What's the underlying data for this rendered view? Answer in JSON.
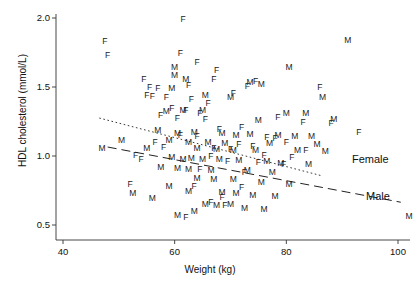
{
  "chart_data": {
    "type": "scatter",
    "title": "",
    "xlabel": "Weight (kg)",
    "ylabel": "HDL cholesterol (mmol/L)",
    "xlim": [
      40,
      103
    ],
    "ylim": [
      0.42,
      2.08
    ],
    "xticks": [
      40,
      60,
      80,
      100
    ],
    "yticks": [
      0.5,
      1.0,
      1.5,
      2.0
    ],
    "xtick_labels": [
      "40",
      "60",
      "80",
      "100"
    ],
    "ytick_labels": [
      "0.5",
      "1.0",
      "1.5",
      "2.0"
    ],
    "grid": false,
    "legend_position": "in-plot-right",
    "point_marker": "letter",
    "marker_meaning": {
      "F": "Female",
      "M": "Male"
    },
    "series": [
      {
        "name": "Female",
        "marker": "F",
        "trend_line": {
          "style": "dotted",
          "label": "Female",
          "x": [
            46.5,
            86.5
          ],
          "y": [
            1.275,
            0.855
          ]
        },
        "points": [
          {
            "x": 47.5,
            "y": 1.83
          },
          {
            "x": 48.0,
            "y": 1.735
          },
          {
            "x": 54.5,
            "y": 1.56
          },
          {
            "x": 55.5,
            "y": 1.5
          },
          {
            "x": 57.0,
            "y": 1.495
          },
          {
            "x": 61.5,
            "y": 1.99
          },
          {
            "x": 61.0,
            "y": 1.745
          },
          {
            "x": 64.0,
            "y": 1.68
          },
          {
            "x": 67.5,
            "y": 1.625
          },
          {
            "x": 67.0,
            "y": 1.555
          },
          {
            "x": 74.5,
            "y": 1.545
          },
          {
            "x": 62.5,
            "y": 1.515
          },
          {
            "x": 73.0,
            "y": 1.51
          },
          {
            "x": 86.0,
            "y": 1.5
          },
          {
            "x": 70.5,
            "y": 1.455
          },
          {
            "x": 55.0,
            "y": 1.44
          },
          {
            "x": 56.0,
            "y": 1.435
          },
          {
            "x": 58.5,
            "y": 1.43
          },
          {
            "x": 63.0,
            "y": 1.415
          },
          {
            "x": 66.0,
            "y": 1.385
          },
          {
            "x": 59.5,
            "y": 1.345
          },
          {
            "x": 62.0,
            "y": 1.335
          },
          {
            "x": 64.5,
            "y": 1.315
          },
          {
            "x": 57.5,
            "y": 1.3
          },
          {
            "x": 60.5,
            "y": 1.275
          },
          {
            "x": 65.5,
            "y": 1.265
          },
          {
            "x": 78.5,
            "y": 1.28
          },
          {
            "x": 83.0,
            "y": 1.245
          },
          {
            "x": 88.0,
            "y": 1.24
          },
          {
            "x": 72.0,
            "y": 1.21
          },
          {
            "x": 68.0,
            "y": 1.195
          },
          {
            "x": 93.0,
            "y": 1.175
          },
          {
            "x": 61.0,
            "y": 1.155
          },
          {
            "x": 64.0,
            "y": 1.145
          },
          {
            "x": 76.5,
            "y": 1.135
          },
          {
            "x": 78.0,
            "y": 1.13
          },
          {
            "x": 80.0,
            "y": 1.1
          },
          {
            "x": 56.5,
            "y": 1.1
          },
          {
            "x": 71.5,
            "y": 1.085
          },
          {
            "x": 74.0,
            "y": 1.075
          },
          {
            "x": 58.0,
            "y": 1.065
          },
          {
            "x": 67.0,
            "y": 1.06
          },
          {
            "x": 70.0,
            "y": 1.05
          },
          {
            "x": 83.5,
            "y": 1.045
          },
          {
            "x": 53.0,
            "y": 1.01
          },
          {
            "x": 66.5,
            "y": 1.0
          },
          {
            "x": 76.0,
            "y": 1.005
          },
          {
            "x": 81.0,
            "y": 0.99
          },
          {
            "x": 54.0,
            "y": 0.975
          },
          {
            "x": 69.5,
            "y": 0.965
          },
          {
            "x": 75.0,
            "y": 0.955
          },
          {
            "x": 79.5,
            "y": 0.945
          },
          {
            "x": 64.5,
            "y": 0.905
          },
          {
            "x": 72.5,
            "y": 0.885
          },
          {
            "x": 52.0,
            "y": 0.795
          },
          {
            "x": 63.5,
            "y": 0.78
          },
          {
            "x": 72.0,
            "y": 0.775
          },
          {
            "x": 68.5,
            "y": 0.7
          },
          {
            "x": 66.5,
            "y": 0.67
          },
          {
            "x": 69.0,
            "y": 0.645
          },
          {
            "x": 62.0,
            "y": 0.56
          }
        ]
      },
      {
        "name": "Male",
        "marker": "M",
        "trend_line": {
          "style": "dashed",
          "label": "Male",
          "x": [
            48.0,
            100.5
          ],
          "y": [
            1.065,
            0.665
          ]
        },
        "points": [
          {
            "x": 60.0,
            "y": 1.645
          },
          {
            "x": 60.0,
            "y": 1.585
          },
          {
            "x": 59.5,
            "y": 1.49
          },
          {
            "x": 62.0,
            "y": 1.56
          },
          {
            "x": 73.5,
            "y": 1.535
          },
          {
            "x": 75.5,
            "y": 1.52
          },
          {
            "x": 80.5,
            "y": 1.645
          },
          {
            "x": 91.0,
            "y": 1.84
          },
          {
            "x": 65.5,
            "y": 1.44
          },
          {
            "x": 70.0,
            "y": 1.43
          },
          {
            "x": 86.5,
            "y": 1.43
          },
          {
            "x": 58.5,
            "y": 1.325
          },
          {
            "x": 61.5,
            "y": 1.335
          },
          {
            "x": 65.0,
            "y": 1.33
          },
          {
            "x": 80.0,
            "y": 1.31
          },
          {
            "x": 83.5,
            "y": 1.31
          },
          {
            "x": 75.0,
            "y": 1.26
          },
          {
            "x": 88.5,
            "y": 1.265
          },
          {
            "x": 57.0,
            "y": 1.185
          },
          {
            "x": 60.5,
            "y": 1.17
          },
          {
            "x": 63.5,
            "y": 1.175
          },
          {
            "x": 68.5,
            "y": 1.165
          },
          {
            "x": 71.0,
            "y": 1.155
          },
          {
            "x": 73.5,
            "y": 1.16
          },
          {
            "x": 78.5,
            "y": 1.155
          },
          {
            "x": 81.5,
            "y": 1.145
          },
          {
            "x": 84.5,
            "y": 1.145
          },
          {
            "x": 50.5,
            "y": 1.115
          },
          {
            "x": 59.0,
            "y": 1.115
          },
          {
            "x": 62.5,
            "y": 1.105
          },
          {
            "x": 66.0,
            "y": 1.1
          },
          {
            "x": 69.0,
            "y": 1.095
          },
          {
            "x": 77.0,
            "y": 1.095
          },
          {
            "x": 85.5,
            "y": 1.09
          },
          {
            "x": 47.0,
            "y": 1.06
          },
          {
            "x": 55.0,
            "y": 1.06
          },
          {
            "x": 64.0,
            "y": 1.055
          },
          {
            "x": 67.5,
            "y": 1.05
          },
          {
            "x": 70.5,
            "y": 1.045
          },
          {
            "x": 74.5,
            "y": 1.04
          },
          {
            "x": 82.0,
            "y": 1.04
          },
          {
            "x": 87.0,
            "y": 1.035
          },
          {
            "x": 59.5,
            "y": 0.99
          },
          {
            "x": 61.5,
            "y": 0.98
          },
          {
            "x": 63.0,
            "y": 0.985
          },
          {
            "x": 65.0,
            "y": 0.975
          },
          {
            "x": 68.0,
            "y": 0.975
          },
          {
            "x": 71.5,
            "y": 0.97
          },
          {
            "x": 76.5,
            "y": 0.965
          },
          {
            "x": 79.0,
            "y": 0.95
          },
          {
            "x": 84.0,
            "y": 0.945
          },
          {
            "x": 57.5,
            "y": 0.92
          },
          {
            "x": 60.5,
            "y": 0.915
          },
          {
            "x": 62.5,
            "y": 0.905
          },
          {
            "x": 66.5,
            "y": 0.9
          },
          {
            "x": 73.0,
            "y": 0.895
          },
          {
            "x": 77.5,
            "y": 0.885
          },
          {
            "x": 52.5,
            "y": 0.735
          },
          {
            "x": 64.0,
            "y": 0.84
          },
          {
            "x": 67.0,
            "y": 0.83
          },
          {
            "x": 70.5,
            "y": 0.83
          },
          {
            "x": 75.5,
            "y": 0.815
          },
          {
            "x": 80.5,
            "y": 0.8
          },
          {
            "x": 59.0,
            "y": 0.78
          },
          {
            "x": 62.5,
            "y": 0.745
          },
          {
            "x": 68.5,
            "y": 0.74
          },
          {
            "x": 71.0,
            "y": 0.735
          },
          {
            "x": 74.0,
            "y": 0.72
          },
          {
            "x": 78.0,
            "y": 0.71
          },
          {
            "x": 56.0,
            "y": 0.695
          },
          {
            "x": 65.5,
            "y": 0.655
          },
          {
            "x": 67.5,
            "y": 0.645
          },
          {
            "x": 70.0,
            "y": 0.655
          },
          {
            "x": 72.5,
            "y": 0.62
          },
          {
            "x": 76.0,
            "y": 0.615
          },
          {
            "x": 102.0,
            "y": 0.565
          },
          {
            "x": 63.5,
            "y": 0.6
          },
          {
            "x": 60.5,
            "y": 0.575
          }
        ]
      }
    ]
  },
  "axis": {
    "x_title": "Weight (kg)",
    "y_title": "HDL cholesterol (mmol/L)"
  },
  "legend": {
    "female_label": "Female",
    "male_label": "Male"
  }
}
